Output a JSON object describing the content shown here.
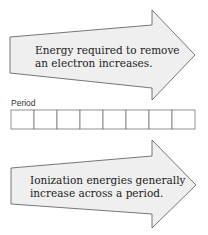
{
  "arrows": [
    {
      "lines": [
        "Energy required to remove",
        "an electron increases."
      ]
    },
    {
      "lines": [
        "Ionization energies generally",
        "increase across a period."
      ]
    }
  ],
  "period_table": {
    "label": "Period",
    "cell_count": 8
  },
  "colors": {
    "arrow_fill": "#efefef",
    "arrow_stroke": "#555555",
    "table_stroke": "#777777"
  }
}
